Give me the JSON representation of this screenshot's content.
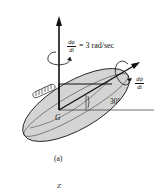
{
  "figure": {
    "caption": "(a)",
    "next_label": "Z",
    "precession": {
      "numerator": "dφ",
      "denominator": "dt",
      "value": "= 3 rad/sec"
    },
    "spin": {
      "numerator": "dψ",
      "denominator": "dt"
    },
    "angle_label": "30°",
    "center_label": "G",
    "colors": {
      "ellipsoid_fill": "#d4d4d4",
      "stroke": "#111111"
    }
  }
}
